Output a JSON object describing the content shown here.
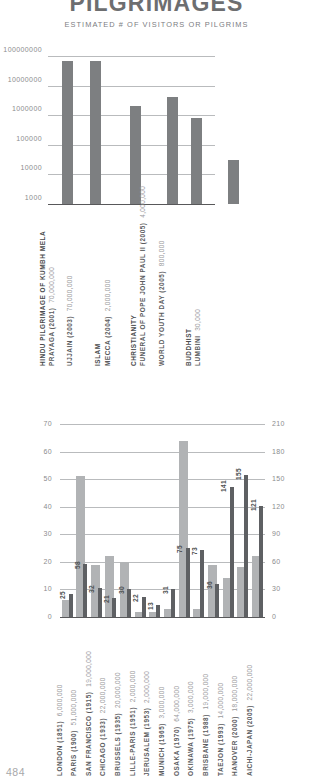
{
  "header": {
    "title": "PILGRIMAGES",
    "subtitle": "ESTIMATED # OF VISITORS OR PILGRIMS"
  },
  "page_number": "484",
  "chart_data": [
    {
      "type": "bar",
      "title": "PILGRIMAGES",
      "subtitle": "ESTIMATED # OF VISITORS OR PILGRIMS",
      "scale": "log",
      "ylim": [
        1000,
        100000000
      ],
      "yticks": [
        "1000",
        "10000",
        "100000",
        "1000000",
        "10000000",
        "100000000"
      ],
      "grid": true,
      "xlabel": "",
      "ylabel": "",
      "group_labels": [
        "HINDU PILGRIMAGE OF KUMBH MELA",
        "ISLAM",
        "CHRISTIANITY",
        "BUDDHIST"
      ],
      "categories": [
        "PRAYAGA (2001)",
        "UJJAIN (2003)",
        "MECCA (2004)",
        "FUNERAL OF POPE JOHN PAUL II (2005)",
        "WORLD YOUTH DAY (2005)",
        "LUMBINI"
      ],
      "value_labels": [
        "70,000,000",
        "70,000,000",
        "2,000,000",
        "4,000,000",
        "800,000",
        "30,000"
      ],
      "values": [
        70000000,
        70000000,
        2000000,
        4000000,
        800000,
        30000
      ]
    },
    {
      "type": "bar",
      "title": "",
      "grid": true,
      "ylabel_left": "",
      "ylabel_right": "",
      "ylim_left": [
        0,
        70
      ],
      "ylim_right": [
        0,
        210
      ],
      "yticks_left": [
        "0",
        "10",
        "20",
        "30",
        "40",
        "50",
        "60",
        "70"
      ],
      "yticks_right": [
        "0",
        "30",
        "60",
        "90",
        "120",
        "150",
        "180",
        "210"
      ],
      "categories": [
        "LONDON (1851)",
        "PARIS (1900)",
        "SAN FRANCISCO (1915)",
        "CHICAGO (1933)",
        "BRUSSELS (1935)",
        "LILLE-PARIS (1951)",
        "JERUSALEM (1953)",
        "MUNICH (1965)",
        "OSAKA (1970)",
        "OKINAWA (1975)",
        "BRISBANE (1988)",
        "TAEJON (1993)",
        "HANOVER (2000)",
        "AICHI-JAPAN (2005)"
      ],
      "category_values": [
        "6,000,000",
        "51,000,000",
        "19,000,000",
        "22,000,000",
        "20,000,000",
        "2,000,000",
        "2,000,000",
        "3,000,000",
        "64,000,000",
        "3,000,000",
        "19,000,000",
        "14,000,000",
        "18,000,000",
        "22,000,000"
      ],
      "series": [
        {
          "name": "visitors-millions",
          "color": "#b1b3b5",
          "values": [
            6,
            51,
            19,
            22,
            20,
            2,
            2,
            3,
            64,
            3,
            19,
            14,
            18,
            22
          ]
        },
        {
          "name": "duration-days",
          "color": "#5e6063",
          "values": [
            25,
            58,
            32,
            21,
            30,
            22,
            13,
            31,
            75,
            73,
            36,
            141,
            155,
            121
          ]
        }
      ],
      "data_labels": [
        "25",
        "58",
        "32",
        "21",
        "30",
        "22",
        "13",
        "31",
        "75",
        "73",
        "36",
        "141",
        "155",
        "121"
      ]
    }
  ]
}
